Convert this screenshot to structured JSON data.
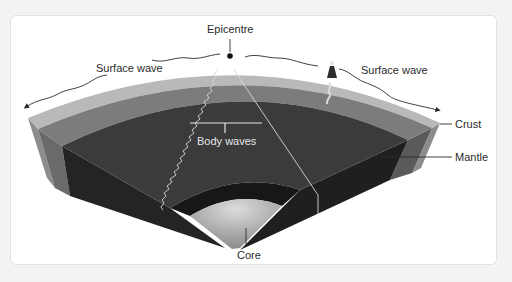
{
  "diagram": {
    "labels": {
      "epicentre": "Epicentre",
      "surface_wave_left": "Surface wave",
      "surface_wave_right": "Surface wave",
      "body_waves": "Body waves",
      "crust": "Crust",
      "mantle": "Mantle",
      "core": "Core"
    },
    "colors": {
      "background": "#f3f3f3",
      "card": "#ffffff",
      "crust_outer": "#b8b8b8",
      "crust": "#7c7c7c",
      "mantle_top": "#3b3b3b",
      "mantle_side": "#262626",
      "side_light": "#6e6e6e",
      "core_light": "#d6d6d6",
      "core_dark": "#8a8a8a",
      "line": "#2a2a2a",
      "wave_light": "#d8d8d8"
    },
    "icons": [
      "epicentre-dot-icon",
      "person-icon",
      "arrow-left-icon",
      "arrow-right-icon"
    ]
  }
}
